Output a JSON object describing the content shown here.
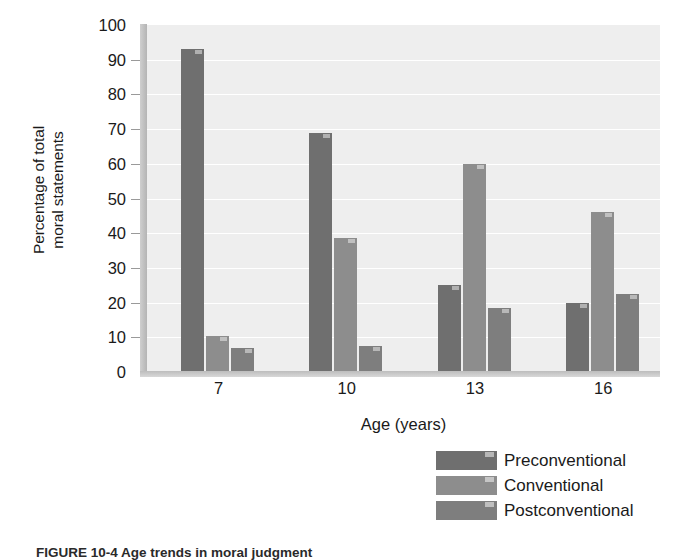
{
  "chart_data": {
    "type": "bar",
    "title": "",
    "xlabel": "Age (years)",
    "ylabel": "Percentage of total moral statements",
    "ylabel_lines": [
      "Percentage of total",
      "moral statements"
    ],
    "categories": [
      "7",
      "10",
      "13",
      "16"
    ],
    "ylim": [
      0,
      100
    ],
    "ytick_step": 10,
    "yticks": [
      "100",
      "90",
      "80",
      "70",
      "60",
      "50",
      "40",
      "30",
      "20",
      "10",
      "0"
    ],
    "grid": true,
    "grid_color": "#ffffff",
    "plot_background": "#eeeeee",
    "legend_position": "bottom-right",
    "series": [
      {
        "name": "Preconventional",
        "color": "#6f6f6f",
        "values": [
          93,
          69,
          25,
          20
        ]
      },
      {
        "name": "Conventional",
        "color": "#8d8d8d",
        "values": [
          10.5,
          38.5,
          60,
          46
        ]
      },
      {
        "name": "Postconventional",
        "color": "#7e7e7e",
        "values": [
          7,
          7.5,
          18.5,
          22.5
        ]
      }
    ]
  },
  "caption": "FIGURE 10-4  Age trends in moral judgment"
}
